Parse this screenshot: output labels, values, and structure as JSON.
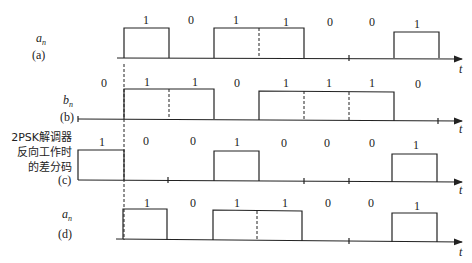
{
  "figure": {
    "rows": [
      {
        "id": "a",
        "signal_label": "a",
        "signal_sub": "n",
        "row_label": "(a)",
        "bits": [
          "1",
          "0",
          "1",
          "1",
          "0",
          "0",
          "1"
        ]
      },
      {
        "id": "b",
        "signal_label": "b",
        "signal_sub": "n",
        "row_label": "(b)",
        "bits": [
          "0",
          "1",
          "1",
          "0",
          "1",
          "1",
          "1",
          "0"
        ]
      },
      {
        "id": "c",
        "signal_label_lines": [
          "2PSK解调器",
          "反向工作时",
          "的差分码"
        ],
        "row_label": "(c)",
        "bits": [
          "1",
          "0",
          "0",
          "1",
          "0",
          "0",
          "0",
          "1"
        ]
      },
      {
        "id": "d",
        "signal_label": "a",
        "signal_sub": "n",
        "row_label": "(d)",
        "bits": [
          "1",
          "0",
          "1",
          "1",
          "0",
          "0",
          "1"
        ]
      }
    ],
    "axis_label": "t"
  }
}
